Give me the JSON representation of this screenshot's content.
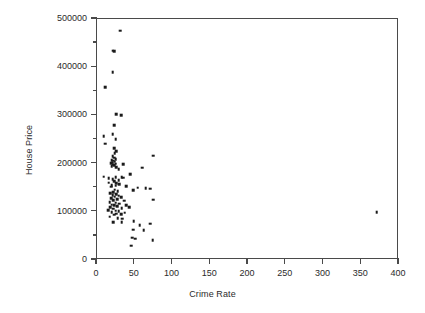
{
  "chart_data": {
    "type": "scatter",
    "title": "",
    "xlabel": "Crime Rate",
    "ylabel": "House Price",
    "xlim": [
      0,
      400
    ],
    "ylim": [
      0,
      500000
    ],
    "xticks": [
      0,
      50,
      100,
      150,
      200,
      250,
      300,
      350,
      400
    ],
    "xtick_labels": [
      "0",
      "50",
      "100",
      "150",
      "200",
      "250",
      "300",
      "350",
      "400"
    ],
    "yticks": [
      0,
      100000,
      200000,
      300000,
      400000,
      500000
    ],
    "ytick_labels": [
      "0",
      "100000",
      "200000",
      "300000",
      "400000",
      "500000"
    ],
    "y_minor_ticks": [
      50000,
      150000,
      250000,
      350000,
      450000
    ],
    "grid": false,
    "legend": null,
    "marker": "square",
    "marker_color": "#1a1a1a",
    "marker_size": 2.6,
    "points": [
      [
        32,
        474000
      ],
      [
        22,
        432000
      ],
      [
        24,
        431000
      ],
      [
        22,
        388000
      ],
      [
        12,
        356000
      ],
      [
        33,
        298000
      ],
      [
        27,
        300000
      ],
      [
        24,
        277000
      ],
      [
        22,
        259000
      ],
      [
        10,
        255000
      ],
      [
        26,
        248000
      ],
      [
        12,
        239000
      ],
      [
        24,
        230000
      ],
      [
        27,
        224000
      ],
      [
        25,
        219000
      ],
      [
        22,
        213000
      ],
      [
        76,
        214000
      ],
      [
        24,
        210000
      ],
      [
        26,
        207000
      ],
      [
        21,
        205000
      ],
      [
        23,
        204000
      ],
      [
        25,
        202000
      ],
      [
        22,
        200000
      ],
      [
        20,
        199000
      ],
      [
        26,
        198000
      ],
      [
        23,
        196000
      ],
      [
        24,
        194000
      ],
      [
        36,
        197000
      ],
      [
        21,
        192000
      ],
      [
        27,
        190000
      ],
      [
        61,
        189000
      ],
      [
        30,
        186000
      ],
      [
        10,
        171000
      ],
      [
        45,
        176000
      ],
      [
        17,
        168000
      ],
      [
        26,
        170000
      ],
      [
        34,
        170000
      ],
      [
        36,
        169000
      ],
      [
        22,
        166000
      ],
      [
        30,
        164000
      ],
      [
        24,
        162000
      ],
      [
        17,
        158000
      ],
      [
        27,
        157000
      ],
      [
        31,
        155000
      ],
      [
        21,
        153000
      ],
      [
        26,
        152000
      ],
      [
        20,
        150000
      ],
      [
        40,
        151000
      ],
      [
        55,
        148000
      ],
      [
        66,
        147000
      ],
      [
        72,
        146000
      ],
      [
        25,
        144000
      ],
      [
        49,
        143000
      ],
      [
        29,
        141000
      ],
      [
        23,
        138000
      ],
      [
        19,
        136000
      ],
      [
        27,
        134000
      ],
      [
        22,
        132000
      ],
      [
        30,
        131000
      ],
      [
        25,
        129000
      ],
      [
        33,
        128000
      ],
      [
        20,
        126000
      ],
      [
        28,
        124000
      ],
      [
        23,
        122000
      ],
      [
        37,
        121000
      ],
      [
        76,
        123000
      ],
      [
        18,
        118000
      ],
      [
        26,
        117000
      ],
      [
        31,
        115000
      ],
      [
        21,
        113000
      ],
      [
        24,
        111000
      ],
      [
        40,
        112000
      ],
      [
        28,
        109000
      ],
      [
        19,
        107000
      ],
      [
        34,
        106000
      ],
      [
        23,
        104000
      ],
      [
        44,
        108000
      ],
      [
        16,
        101000
      ],
      [
        26,
        100000
      ],
      [
        30,
        99000
      ],
      [
        21,
        97000
      ],
      [
        38,
        96000
      ],
      [
        27,
        94000
      ],
      [
        33,
        93000
      ],
      [
        24,
        92000
      ],
      [
        372,
        97000
      ],
      [
        18,
        88000
      ],
      [
        29,
        85000
      ],
      [
        35,
        84000
      ],
      [
        23,
        76000
      ],
      [
        34,
        76000
      ],
      [
        50,
        79000
      ],
      [
        58,
        70000
      ],
      [
        72,
        73000
      ],
      [
        49,
        61000
      ],
      [
        63,
        60000
      ],
      [
        48,
        44000
      ],
      [
        52,
        42000
      ],
      [
        75,
        39000
      ],
      [
        47,
        28000
      ]
    ]
  }
}
